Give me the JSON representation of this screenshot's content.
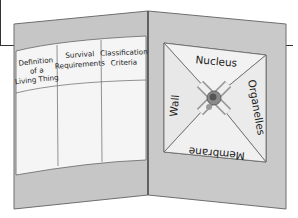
{
  "figure": {
    "type": "foldable-organizer-illustration",
    "left_panel": {
      "table_headers": [
        [
          "Definition",
          "of a",
          "Living Thing"
        ],
        [
          "Survival",
          "Requirements"
        ],
        [
          "Classification",
          "Criteria"
        ]
      ]
    },
    "right_panel": {
      "flaps": {
        "top": "Nucleus",
        "right": "Organelles",
        "bottom": "Membrane",
        "left": "Wall"
      }
    },
    "colors": {
      "folder": "#c4c4c4",
      "folder_edge": "#7a7a7a",
      "paper": "#f4f4f4",
      "flap": "#ececec",
      "center_button": "#6a6a6a"
    }
  }
}
